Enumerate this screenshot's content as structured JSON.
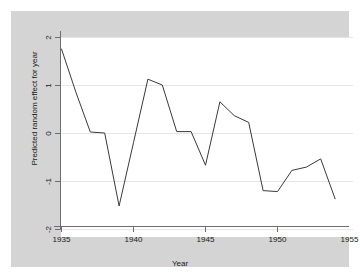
{
  "chart_data": {
    "type": "line",
    "title": "",
    "subtitle": "",
    "xlabel": "Year",
    "ylabel": "Predicted random effect for year",
    "xlim": [
      1934.0,
      1955.4
    ],
    "ylim": [
      -2.1,
      2.1
    ],
    "grid": true,
    "legend": null,
    "x_ticks": [
      1935,
      1940,
      1945,
      1950,
      1955
    ],
    "x_tick_labels": [
      "1935",
      "1940",
      "1945",
      "1950",
      "1955"
    ],
    "y_ticks": [
      2,
      1,
      0,
      -1,
      -2
    ],
    "y_tick_labels": [
      "2",
      "1",
      "0",
      "-1",
      "-2"
    ],
    "line_color": "#3a3a3a",
    "background_color": "#d4d4d4",
    "plot_background_color": "#ffffff",
    "grid_color": "#e6e6ea",
    "series": [
      {
        "name": "Predicted random effect for year",
        "x": [
          1935,
          1936,
          1937,
          1938,
          1939,
          1940,
          1941,
          1942,
          1943,
          1944,
          1945,
          1946,
          1947,
          1948,
          1949,
          1950,
          1951,
          1952,
          1953,
          1954
        ],
        "values": [
          1.75,
          0.85,
          0.02,
          0.0,
          -1.52,
          -0.2,
          1.12,
          1.0,
          0.03,
          0.03,
          -0.67,
          0.65,
          0.36,
          0.22,
          -1.2,
          -1.22,
          -0.78,
          -0.71,
          -0.54,
          -1.37
        ]
      }
    ]
  },
  "axes": {
    "x_title": "Year",
    "y_title": "Predicted random effect for year",
    "x_tick_labels": [
      "1935",
      "1940",
      "1945",
      "1950",
      "1955"
    ],
    "y_tick_labels": [
      "2",
      "1",
      "0",
      "-1",
      "-2"
    ]
  }
}
